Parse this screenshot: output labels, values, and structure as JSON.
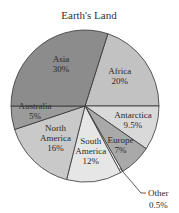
{
  "chart_data": {
    "type": "pie",
    "title": "Earth's Land",
    "start_angle_deg": -72,
    "direction": "clockwise",
    "slices": [
      {
        "name": "Africa",
        "value": 20,
        "label_lines": [
          "Africa",
          "20%"
        ],
        "color": "#c2c2c2"
      },
      {
        "name": "Antarctica",
        "value": 9.5,
        "label_lines": [
          "Antarctica",
          "9.5%"
        ],
        "color": "#d9d9d9"
      },
      {
        "name": "Europe",
        "value": 7,
        "label_lines": [
          "Europe",
          "7%"
        ],
        "color": "#a9a9a9"
      },
      {
        "name": "Other",
        "value": 0.5,
        "label_lines": [
          "Other",
          "0.5%"
        ],
        "color": "#ffffff",
        "external_label": true
      },
      {
        "name": "South America",
        "value": 12,
        "label_lines": [
          "South",
          "America",
          "12%"
        ],
        "color": "#e6e6e6"
      },
      {
        "name": "North America",
        "value": 16,
        "label_lines": [
          "North",
          "America",
          "16%"
        ],
        "color": "#c9c9c9"
      },
      {
        "name": "Australia",
        "value": 5,
        "label_lines": [
          "Australia",
          "5%"
        ],
        "color": "#9b9b9b"
      },
      {
        "name": "Asia",
        "value": 30,
        "label_lines": [
          "Asia",
          "30%"
        ],
        "color": "#8c8c8c"
      }
    ]
  }
}
